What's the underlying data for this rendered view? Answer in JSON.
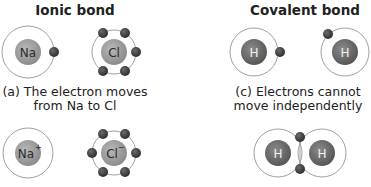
{
  "ionic": {
    "title": "Ionic bond",
    "caption_line1": "(a) The electron moves",
    "caption_line2": "from Na to Cl",
    "before": {
      "atom1": {
        "symbol": "Na",
        "electrons": 1
      },
      "atom2": {
        "symbol": "Cl",
        "electrons": 6
      }
    },
    "after": {
      "atom1": {
        "symbol": "Na",
        "charge": "+",
        "electrons": 0
      },
      "atom2": {
        "symbol": "Cl",
        "charge": "−",
        "electrons": 6
      }
    }
  },
  "covalent": {
    "title": "Covalent bond",
    "caption_line1": "(c) Electrons cannot",
    "caption_line2": "move independently",
    "before": {
      "atom1": {
        "symbol": "H",
        "electrons": 1
      },
      "atom2": {
        "symbol": "H",
        "electrons": 1
      }
    },
    "after": {
      "atom1": {
        "symbol": "H"
      },
      "atom2": {
        "symbol": "H"
      },
      "shared_electrons": 2
    }
  },
  "colors": {
    "ionic_nucleus": "#9a9a9a",
    "covalent_nucleus": "#6a6a6a",
    "electron": "#3a3a3a",
    "orbit": "#9a9a9a",
    "symbol_ionic": "#2a2a2a",
    "symbol_covalent": "#f2f2f2"
  }
}
